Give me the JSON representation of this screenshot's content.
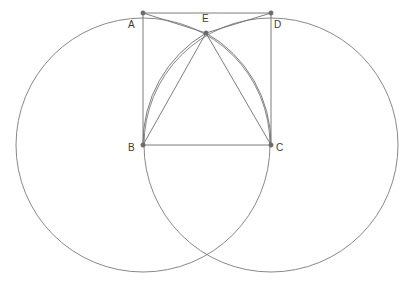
{
  "figure": {
    "background_color": "#ffffff",
    "stroke_color": "#7a7a7a",
    "square_stroke_color": "#6e6e6e",
    "arc_stroke_color": "#6e6e6e",
    "vertex_dot_color": "#6b6b6b",
    "label_color": "#3b3b3b",
    "width": 408,
    "height": 283
  },
  "circles": [
    {
      "name": "circle-left",
      "cx": 143,
      "cy": 145,
      "r": 127
    },
    {
      "name": "circle-right",
      "cx": 271,
      "cy": 145,
      "r": 127
    }
  ],
  "points": [
    {
      "id": "A",
      "label": "A",
      "x": 143,
      "y": 13,
      "label_x": 128,
      "label_y": 20
    },
    {
      "id": "D",
      "label": "D",
      "x": 271,
      "y": 13,
      "label_x": 274,
      "label_y": 20
    },
    {
      "id": "E",
      "label": "E",
      "x": 206,
      "y": 33,
      "label_x": 202,
      "label_y": 14
    },
    {
      "id": "B",
      "label": "B",
      "x": 143,
      "y": 145,
      "label_x": 128,
      "label_y": 143
    },
    {
      "id": "C",
      "label": "C",
      "x": 271,
      "y": 145,
      "label_x": 276,
      "label_y": 143
    }
  ],
  "segments": [
    {
      "name": "side-AD",
      "from": "A",
      "to": "D"
    },
    {
      "name": "side-AB",
      "from": "A",
      "to": "B"
    },
    {
      "name": "side-DC",
      "from": "D",
      "to": "C"
    },
    {
      "name": "side-BC",
      "from": "B",
      "to": "C"
    },
    {
      "name": "segment-AE",
      "from": "A",
      "to": "E"
    },
    {
      "name": "segment-ED",
      "from": "E",
      "to": "D"
    },
    {
      "name": "segment-EB",
      "from": "E",
      "to": "B"
    },
    {
      "name": "segment-EC",
      "from": "E",
      "to": "C"
    }
  ],
  "arcs": [
    {
      "name": "arc-B-to-E",
      "center": "B",
      "from": "C",
      "to": "E"
    },
    {
      "name": "arc-C-to-E",
      "center": "C",
      "from": "B",
      "to": "E"
    }
  ],
  "intersections": [
    {
      "name": "upper-intersection",
      "x": 206,
      "y": 33
    },
    {
      "name": "lower-intersection",
      "x": 207,
      "y": 252
    }
  ]
}
